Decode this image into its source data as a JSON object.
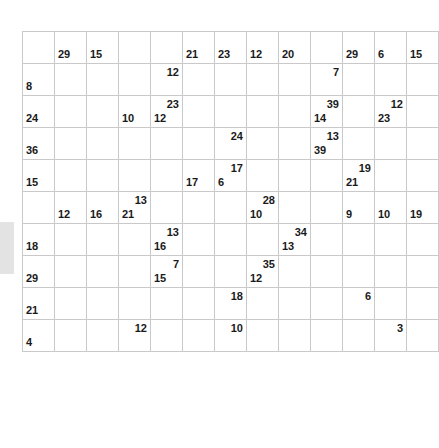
{
  "puzzle": {
    "type": "kakuro",
    "columns": 13,
    "rows": 10,
    "cell_size_px": 31,
    "colors": {
      "clue_cell": "#9a9a9a",
      "open_cell": "#ffffff",
      "grid_line": "#c9c9c9",
      "diagonal": "#ffffff",
      "number_text": "#1a1a1a",
      "page_background": "#ffffff",
      "left_artifact": "#e3e3e3"
    },
    "legend": {
      "across_position": "upper-right",
      "down_position": "lower-left"
    },
    "grid": [
      [
        {
          "t": "blank"
        },
        {
          "t": "clue",
          "down": "29"
        },
        {
          "t": "clue",
          "down": "15"
        },
        {
          "t": "blank"
        },
        {
          "t": "blank"
        },
        {
          "t": "clue",
          "down": "21"
        },
        {
          "t": "clue",
          "down": "23"
        },
        {
          "t": "clue",
          "down": "12"
        },
        {
          "t": "clue",
          "down": "20"
        },
        {
          "t": "blank"
        },
        {
          "t": "clue",
          "down": "29"
        },
        {
          "t": "clue",
          "down": "6"
        },
        {
          "t": "clue",
          "down": "15"
        }
      ],
      [
        {
          "t": "clue",
          "down": "8"
        },
        {
          "t": "open"
        },
        {
          "t": "open"
        },
        {
          "t": "blank"
        },
        {
          "t": "clue",
          "across": "12"
        },
        {
          "t": "open"
        },
        {
          "t": "open"
        },
        {
          "t": "open"
        },
        {
          "t": "open"
        },
        {
          "t": "clue",
          "across": "7"
        },
        {
          "t": "open"
        },
        {
          "t": "open"
        },
        {
          "t": "open"
        }
      ],
      [
        {
          "t": "clue",
          "down": "24"
        },
        {
          "t": "open"
        },
        {
          "t": "open"
        },
        {
          "t": "clue",
          "down": "10"
        },
        {
          "t": "clue",
          "across": "23",
          "down": "12"
        },
        {
          "t": "open"
        },
        {
          "t": "open"
        },
        {
          "t": "open"
        },
        {
          "t": "open"
        },
        {
          "t": "clue",
          "across": "39",
          "down": "14"
        },
        {
          "t": "open"
        },
        {
          "t": "clue",
          "across": "12",
          "down": "23"
        },
        {
          "t": "open"
        }
      ],
      [
        {
          "t": "clue",
          "down": "36"
        },
        {
          "t": "open"
        },
        {
          "t": "open"
        },
        {
          "t": "open"
        },
        {
          "t": "open"
        },
        {
          "t": "open"
        },
        {
          "t": "clue",
          "across": "24"
        },
        {
          "t": "open"
        },
        {
          "t": "open"
        },
        {
          "t": "clue",
          "across": "13",
          "down": "39"
        },
        {
          "t": "open"
        },
        {
          "t": "open"
        },
        {
          "t": "open"
        }
      ],
      [
        {
          "t": "clue",
          "down": "15"
        },
        {
          "t": "open"
        },
        {
          "t": "open"
        },
        {
          "t": "open"
        },
        {
          "t": "open"
        },
        {
          "t": "clue",
          "down": "17"
        },
        {
          "t": "clue",
          "across": "17",
          "down": "6"
        },
        {
          "t": "open"
        },
        {
          "t": "open"
        },
        {
          "t": "open"
        },
        {
          "t": "clue",
          "across": "19",
          "down": "21"
        },
        {
          "t": "open"
        },
        {
          "t": "open"
        }
      ],
      [
        {
          "t": "blank"
        },
        {
          "t": "clue",
          "down": "12"
        },
        {
          "t": "clue",
          "down": "16"
        },
        {
          "t": "clue",
          "across": "13",
          "down": "21"
        },
        {
          "t": "open"
        },
        {
          "t": "open"
        },
        {
          "t": "open"
        },
        {
          "t": "clue",
          "across": "28",
          "down": "10"
        },
        {
          "t": "open"
        },
        {
          "t": "open"
        },
        {
          "t": "clue",
          "down": "9"
        },
        {
          "t": "clue",
          "down": "10"
        },
        {
          "t": "clue",
          "down": "19"
        }
      ],
      [
        {
          "t": "clue",
          "down": "18"
        },
        {
          "t": "open"
        },
        {
          "t": "open"
        },
        {
          "t": "open"
        },
        {
          "t": "clue",
          "across": "13",
          "down": "16"
        },
        {
          "t": "open"
        },
        {
          "t": "open"
        },
        {
          "t": "blank"
        },
        {
          "t": "clue",
          "across": "34",
          "down": "13"
        },
        {
          "t": "open"
        },
        {
          "t": "open"
        },
        {
          "t": "open"
        },
        {
          "t": "open"
        }
      ],
      [
        {
          "t": "clue",
          "down": "29"
        },
        {
          "t": "open"
        },
        {
          "t": "open"
        },
        {
          "t": "open"
        },
        {
          "t": "clue",
          "across": "7",
          "down": "15"
        },
        {
          "t": "open"
        },
        {
          "t": "open"
        },
        {
          "t": "clue",
          "across": "35",
          "down": "12"
        },
        {
          "t": "open"
        },
        {
          "t": "open"
        },
        {
          "t": "open"
        },
        {
          "t": "open"
        },
        {
          "t": "open"
        }
      ],
      [
        {
          "t": "clue",
          "down": "21"
        },
        {
          "t": "open"
        },
        {
          "t": "open"
        },
        {
          "t": "open"
        },
        {
          "t": "open"
        },
        {
          "t": "open"
        },
        {
          "t": "clue",
          "across": "18"
        },
        {
          "t": "open"
        },
        {
          "t": "open"
        },
        {
          "t": "open"
        },
        {
          "t": "clue",
          "across": "6"
        },
        {
          "t": "open"
        },
        {
          "t": "open"
        }
      ],
      [
        {
          "t": "clue",
          "down": "4"
        },
        {
          "t": "open"
        },
        {
          "t": "open"
        },
        {
          "t": "clue",
          "across": "12"
        },
        {
          "t": "open"
        },
        {
          "t": "open"
        },
        {
          "t": "clue",
          "across": "10"
        },
        {
          "t": "open"
        },
        {
          "t": "open"
        },
        {
          "t": "open"
        },
        {
          "t": "blank"
        },
        {
          "t": "clue",
          "across": "3"
        },
        {
          "t": "open"
        }
      ]
    ]
  }
}
